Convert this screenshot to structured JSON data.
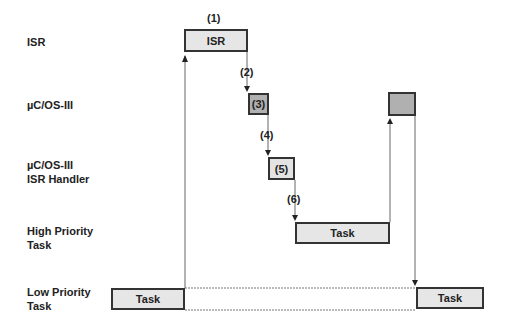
{
  "rows": [
    {
      "label": "ISR"
    },
    {
      "label": "µC/OS-III"
    },
    {
      "label": "µC/OS-III\nISR Handler"
    },
    {
      "label": "High Priority\nTask"
    },
    {
      "label": "Low Priority\nTask"
    }
  ],
  "boxes": {
    "isr": "ISR",
    "step3": "(3)",
    "step5": "(5)",
    "high_task": "Task",
    "low_task_left": "Task",
    "low_task_right": "Task",
    "kernel_return": ""
  },
  "steps": [
    "(1)",
    "(2)",
    "(4)",
    "(6)"
  ],
  "colors": {
    "box_fill": "#e6e6e6",
    "kernel_fill": "#b0b0b0",
    "line": "#555555",
    "border": "#333333"
  }
}
